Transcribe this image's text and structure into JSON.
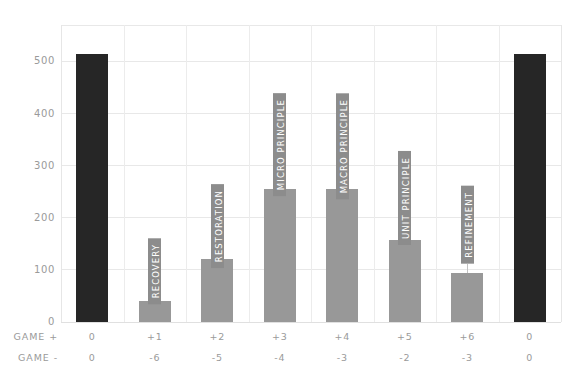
{
  "chart_data": {
    "type": "bar",
    "title": "",
    "subtitle": "",
    "xlabel": "",
    "ylabel": "",
    "ylim": [
      0,
      570
    ],
    "yticks": [
      0,
      100,
      200,
      300,
      400,
      500
    ],
    "ytick_labels": [
      "0",
      "100",
      "200",
      "300",
      "400",
      "500"
    ],
    "grid": true,
    "legend": null,
    "categories": [
      "0",
      "+1",
      "+2",
      "+3",
      "+4",
      "+5",
      "+6",
      "0"
    ],
    "values": [
      515,
      40,
      120,
      255,
      255,
      158,
      95,
      515
    ],
    "bar_colors": [
      "#262626",
      "#989898",
      "#989898",
      "#989898",
      "#989898",
      "#989898",
      "#989898",
      "#262626"
    ],
    "point_labels": [
      "",
      "RECOVERY",
      "RESTORATION",
      "MICRO PRINCIPLE",
      "MACRO PRINCIPLE",
      "UNIT PRINCIPLE",
      "REFINEMENT",
      ""
    ],
    "axis_rows": [
      {
        "title": "GAME +",
        "values": [
          "0",
          "+1",
          "+2",
          "+3",
          "+4",
          "+5",
          "+6",
          "0"
        ]
      },
      {
        "title": "GAME -",
        "values": [
          "0",
          "-6",
          "-5",
          "-4",
          "-3",
          "-2",
          "-3",
          "0"
        ]
      }
    ],
    "colors": {
      "bar_dark": "#262626",
      "bar_light": "#989898",
      "label_chip": "#8c8c8c",
      "grid": "#e8e8e8",
      "text": "#9a9a9a",
      "background": "#ffffff"
    }
  }
}
